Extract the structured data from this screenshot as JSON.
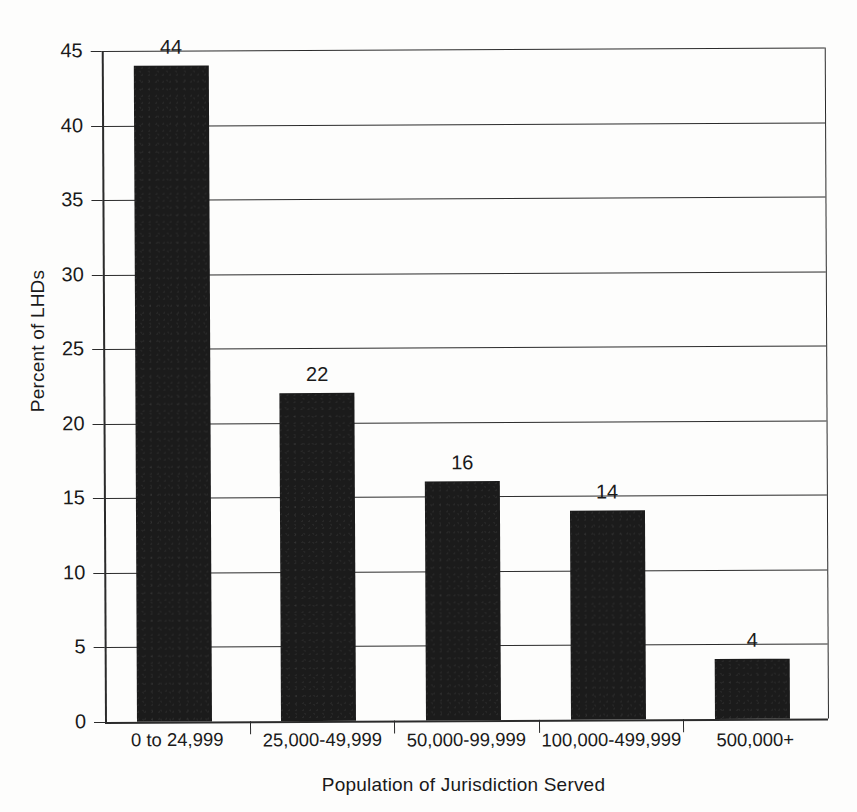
{
  "chart_data": {
    "type": "bar",
    "title": "",
    "xlabel": "Population of Jurisdiction Served",
    "ylabel": "Percent of LHDs",
    "categories": [
      "0 to 24,999",
      "25,000-49,999",
      "50,000-99,999",
      "100,000-499,999",
      "500,000+"
    ],
    "values": [
      44,
      22,
      16,
      14,
      4
    ],
    "value_labels": [
      "44",
      "22",
      "16",
      "14",
      "4"
    ],
    "ylim": [
      0,
      45
    ],
    "y_ticks": [
      45,
      40,
      35,
      30,
      25,
      20,
      15,
      10,
      5,
      0
    ],
    "y_tick_labels": [
      "45",
      "40",
      "35",
      "30",
      "25",
      "20",
      "15",
      "10",
      "5",
      "0"
    ],
    "grid": true,
    "grid_axis": "y",
    "legend": "none",
    "bar_color": "#1b1b1b",
    "axis_color": "#2b2b2b",
    "background": "#fdfdfc"
  }
}
